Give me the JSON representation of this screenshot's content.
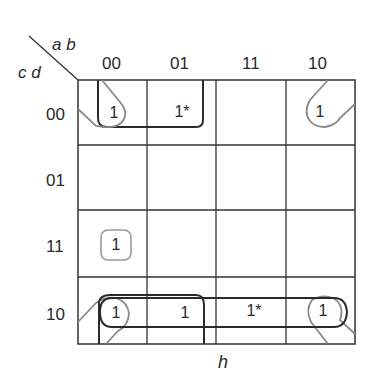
{
  "kmap": {
    "row_var": "c d",
    "col_var": "a b",
    "col_labels": [
      "00",
      "01",
      "11",
      "10"
    ],
    "row_labels": [
      "00",
      "01",
      "11",
      "10"
    ],
    "output_label": "h",
    "cells": {
      "r00c00": "1",
      "r00c01": "1*",
      "r00c10": "1",
      "r11c00": "1",
      "r10c00": "1",
      "r10c01": "1",
      "r10c11": "1*",
      "r10c10": "1"
    },
    "colors": {
      "grid": "#333333",
      "group_dark": "#2a2a2a",
      "group_light": "#8a8a8a"
    }
  }
}
